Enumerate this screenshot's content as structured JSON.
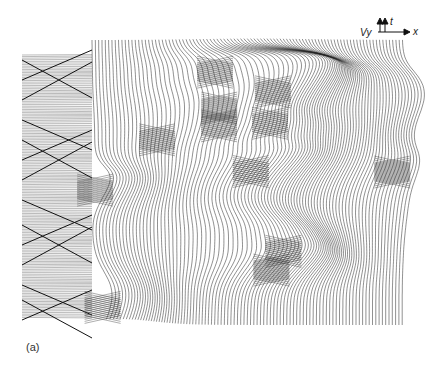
{
  "figure": {
    "panel_label": "(a)",
    "axis_glyph": {
      "v_label": "V",
      "y_label": "y",
      "t_label": "t",
      "x_label": "x"
    }
  }
}
